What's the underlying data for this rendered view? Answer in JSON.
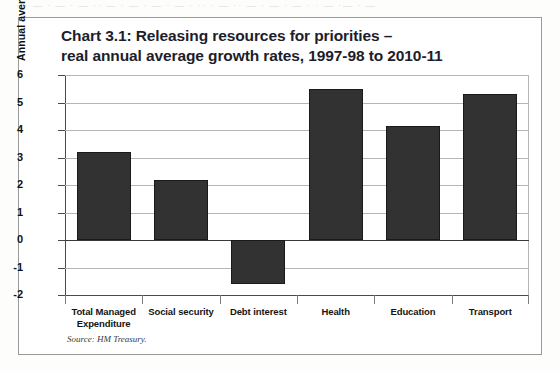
{
  "scan_artifact": "· · — · — ·   — ·· — ·  — · —  · — · ·· ·   — ·· —   · — ·  — · · —  ·— · —",
  "figure": {
    "title_line1": "Chart 3.1: Releasing resources for priorities –",
    "title_line2": "real annual average growth rates, 1997-98 to 2010-11",
    "source": "Source: HM Treasury."
  },
  "chart_data": {
    "type": "bar",
    "title": "Chart 3.1: Releasing resources for priorities – real annual average growth rates, 1997-98 to 2010-11",
    "xlabel": "",
    "ylabel": "Annual average real growth (per cent)",
    "ylim": [
      -2,
      6
    ],
    "yticks": [
      -2,
      -1,
      0,
      1,
      2,
      3,
      4,
      5,
      6
    ],
    "ytick_labels": [
      "-2",
      "-1",
      "0",
      "1",
      "2",
      "3",
      "4",
      "5",
      "6"
    ],
    "grid": true,
    "legend": false,
    "bar_color": "#323232",
    "categories": [
      "Total Managed Expenditure",
      "Social security",
      "Debt interest",
      "Health",
      "Education",
      "Transport"
    ],
    "category_labels": [
      [
        "Total Managed",
        "Expenditure"
      ],
      [
        "Social security"
      ],
      [
        "Debt interest"
      ],
      [
        "Health"
      ],
      [
        "Education"
      ],
      [
        "Transport"
      ]
    ],
    "values": [
      3.2,
      2.2,
      -1.6,
      5.5,
      4.15,
      5.3
    ]
  }
}
